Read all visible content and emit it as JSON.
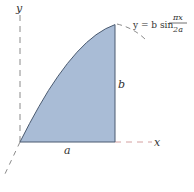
{
  "figure": {
    "axes": {
      "x_label": "x",
      "y_label": "y",
      "z_axis": "dashed oblique axis"
    },
    "region": {
      "fill_color": "#a9bcd6",
      "edge_color": "#4a5a70",
      "width_label": "a",
      "height_label": "b"
    },
    "curve_equation": {
      "lhs": "y = b sin",
      "numerator": "πx",
      "denominator": "2a"
    },
    "colors": {
      "axis_dash": "#888888",
      "extension_dash": "#d4a0a0"
    }
  }
}
